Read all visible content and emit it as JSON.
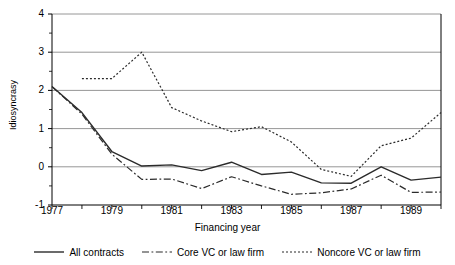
{
  "chart_data": {
    "type": "line",
    "title": "",
    "xlabel": "Financing year",
    "ylabel": "Idiosyncrasy",
    "xlim": [
      1977,
      1990
    ],
    "ylim": [
      -1,
      4
    ],
    "xticks": [
      1977,
      1978,
      1979,
      1980,
      1981,
      1982,
      1983,
      1984,
      1985,
      1986,
      1987,
      1988,
      1989,
      1990
    ],
    "xtick_labels": [
      "1977",
      "",
      "1979",
      "",
      "1981",
      "",
      "1983",
      "",
      "1985",
      "",
      "1987",
      "",
      "1989",
      ""
    ],
    "yticks": [
      -1,
      0,
      1,
      2,
      3,
      4
    ],
    "ytick_labels": [
      "-1",
      "0",
      "1",
      "2",
      "3",
      "4"
    ],
    "grid": "horizontal",
    "legend_position": "bottom",
    "x": [
      1977,
      1978,
      1979,
      1980,
      1981,
      1982,
      1983,
      1984,
      1985,
      1986,
      1987,
      1988,
      1989,
      1990
    ],
    "series": [
      {
        "name": "All contracts",
        "style": "solid",
        "color": "#2b2b2b",
        "values": [
          2.1,
          1.42,
          0.4,
          0.02,
          0.05,
          -0.1,
          0.12,
          -0.2,
          -0.14,
          -0.42,
          -0.43,
          0.0,
          -0.35,
          -0.27
        ]
      },
      {
        "name": "Core VC or law firm",
        "style": "dashdot",
        "color": "#2b2b2b",
        "values": [
          2.1,
          1.38,
          0.33,
          -0.33,
          -0.32,
          -0.57,
          -0.26,
          -0.5,
          -0.72,
          -0.68,
          -0.58,
          -0.22,
          -0.67,
          -0.66
        ]
      },
      {
        "name": "Noncore VC or law firm",
        "style": "dotted",
        "color": "#2b2b2b",
        "values": [
          null,
          2.31,
          2.31,
          3.0,
          1.55,
          1.2,
          0.92,
          1.05,
          0.65,
          -0.07,
          -0.25,
          0.55,
          0.75,
          1.42
        ]
      }
    ]
  },
  "legend": {
    "items": [
      {
        "label": "All contracts",
        "style": "solid"
      },
      {
        "label": "Core VC or law firm",
        "style": "dashdot"
      },
      {
        "label": "Noncore VC or law firm",
        "style": "dotted"
      }
    ]
  },
  "axes": {
    "y_title": "Idiosyncrasy",
    "x_title": "Financing year"
  }
}
